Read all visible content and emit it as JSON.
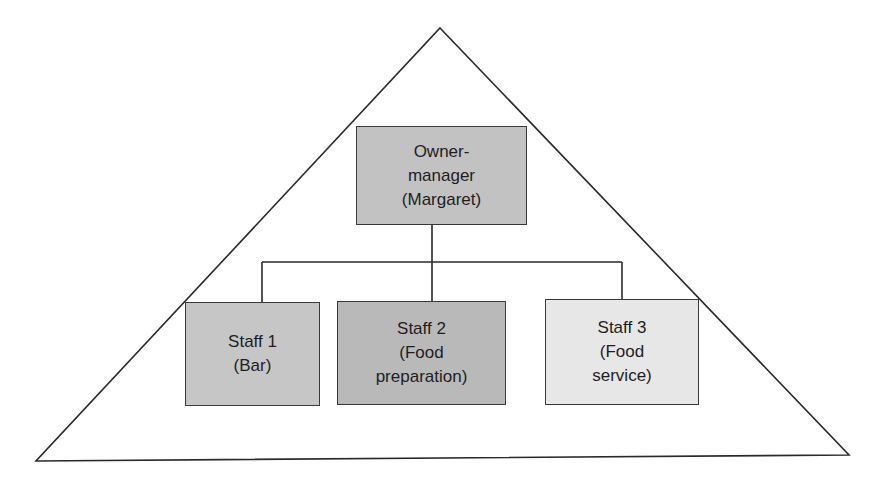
{
  "diagram": {
    "type": "organisational-structure",
    "shape": "pyramid",
    "root": {
      "id": "owner",
      "label": "Owner-\nmanager\n(Margaret)",
      "fill": "#c2c2c2"
    },
    "children": [
      {
        "id": "staff1",
        "label": "Staff 1\n(Bar)",
        "fill": "#c6c6c6"
      },
      {
        "id": "staff2",
        "label": "Staff 2\n(Food\npreparation)",
        "fill": "#b9b9b9"
      },
      {
        "id": "staff3",
        "label": "Staff 3\n(Food\nservice)",
        "fill": "#e7e7e7"
      }
    ],
    "edges": [
      {
        "from": "owner",
        "to": "staff1"
      },
      {
        "from": "owner",
        "to": "staff2"
      },
      {
        "from": "owner",
        "to": "staff3"
      }
    ]
  }
}
